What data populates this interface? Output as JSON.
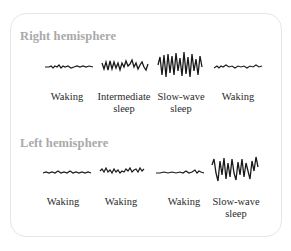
{
  "right": {
    "heading": "Right hemisphere",
    "states": [
      {
        "label_line1": "Waking",
        "label_line2": "",
        "wave": "low"
      },
      {
        "label_line1": "Intermediate",
        "label_line2": "sleep",
        "wave": "medium"
      },
      {
        "label_line1": "Slow-wave",
        "label_line2": "sleep",
        "wave": "high"
      },
      {
        "label_line1": "Waking",
        "label_line2": "",
        "wave": "low"
      }
    ]
  },
  "left": {
    "heading": "Left hemisphere",
    "states": [
      {
        "label_line1": "Waking",
        "label_line2": "",
        "wave": "low"
      },
      {
        "label_line1": "Waking",
        "label_line2": "",
        "wave": "low"
      },
      {
        "label_line1": "Waking",
        "label_line2": "",
        "wave": "low"
      },
      {
        "label_line1": "Slow-wave",
        "label_line2": "sleep",
        "wave": "high"
      }
    ]
  },
  "colors": {
    "heading": "#a9a9a9",
    "wave": "#1a1a1a",
    "label": "#2a2a2a",
    "border": "#e6e6e6"
  }
}
